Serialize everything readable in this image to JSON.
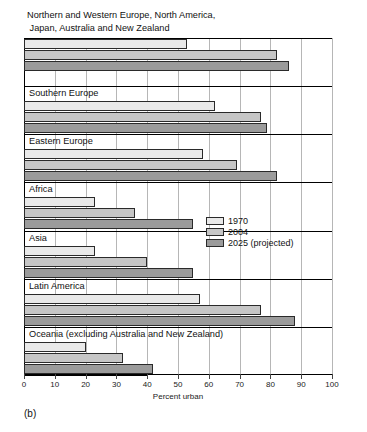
{
  "panel": {
    "label": "(b)"
  },
  "chart_data": {
    "type": "bar",
    "orientation": "horizontal",
    "title": "Northern and Western Europe, North America,\n Japan, Australia and New Zealand",
    "xlabel": "Percent urban",
    "ylabel": "",
    "xlim": [
      0,
      100
    ],
    "xticks": [
      0,
      10,
      20,
      30,
      40,
      50,
      60,
      70,
      80,
      90,
      100
    ],
    "xticklabels": [
      "0",
      "10",
      "20",
      "30",
      "40",
      "50",
      "60",
      "70",
      "80",
      "90",
      "100"
    ],
    "grid": "vertical",
    "legend_position": "center-right",
    "categories": [
      "Northern and Western Europe, North America, Japan, Australia and New Zealand",
      "Southern Europe",
      "Eastern Europe",
      "Africa",
      "Asia",
      "Latin America",
      "Oceania (excluding Australia and New Zealand)"
    ],
    "category_labels": [
      "Northern and Western Europe, North America,\n Japan, Australia and New Zealand",
      "Southern Europe",
      "Eastern Europe",
      "Africa",
      "Asia",
      "Latin America",
      "Oceania (excluding Australia and New Zealand)"
    ],
    "series": [
      {
        "name": "1970",
        "color": "#e9e9e9",
        "values": [
          53,
          62,
          58,
          23,
          23,
          57,
          20
        ]
      },
      {
        "name": "2004",
        "color": "#c6c6c6",
        "values": [
          82,
          77,
          69,
          36,
          40,
          77,
          32
        ]
      },
      {
        "name": "2025 (projected)",
        "color": "#9b9b9b",
        "values": [
          86,
          79,
          82,
          55,
          55,
          88,
          42
        ]
      }
    ]
  },
  "legend": {
    "items": [
      {
        "label": "1970"
      },
      {
        "label": "2004"
      },
      {
        "label": "2025 (projected)"
      }
    ]
  },
  "axis": {
    "title": "Percent urban",
    "ticks": [
      "0",
      "10",
      "20",
      "30",
      "40",
      "50",
      "60",
      "70",
      "80",
      "90",
      "100"
    ]
  },
  "groups": [
    {
      "label": "Northern and Western Europe, North America,\n Japan, Australia and New Zealand",
      "label_outside": true
    },
    {
      "label": "Southern Europe",
      "label_outside": false
    },
    {
      "label": "Eastern Europe",
      "label_outside": false
    },
    {
      "label": "Africa",
      "label_outside": false
    },
    {
      "label": "Asia",
      "label_outside": false
    },
    {
      "label": "Latin America",
      "label_outside": false
    },
    {
      "label": "Oceania (excluding Australia and New Zealand)",
      "label_outside": false
    }
  ]
}
